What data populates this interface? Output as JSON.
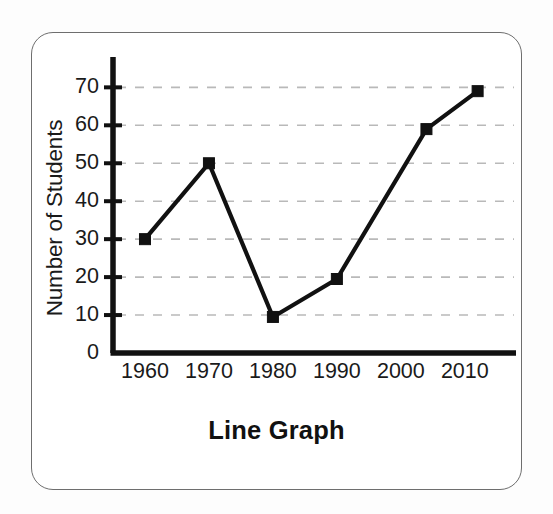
{
  "figure": {
    "title": "Line Graph",
    "y_axis_title": "Number of Students",
    "frame_color": "#6e6e6e",
    "background_color": "#ffffff",
    "series_color": "#111111",
    "gridline_color": "#b9b9b9"
  },
  "axes": {
    "y_ticks": [
      "0",
      "10",
      "20",
      "30",
      "40",
      "50",
      "60",
      "70"
    ],
    "x_ticks": [
      "1960",
      "1970",
      "1980",
      "1990",
      "2000",
      "2010"
    ]
  },
  "chart_data": {
    "type": "line",
    "title": "Line Graph",
    "xlabel": "",
    "ylabel": "Number of Students",
    "categories": [
      "1960",
      "1970",
      "1980",
      "1990",
      "2000",
      "2010"
    ],
    "x": [
      1960,
      1970,
      1980,
      1990,
      2004,
      2012
    ],
    "values": [
      30,
      50,
      9.5,
      19.5,
      59,
      69
    ],
    "ylim": [
      0,
      78
    ],
    "xlim": [
      1955,
      2018
    ],
    "ytick_values": [
      0,
      10,
      20,
      30,
      40,
      50,
      60,
      70
    ],
    "xtick_values": [
      1960,
      1970,
      1980,
      1990,
      2000,
      2010
    ],
    "grid": true,
    "grid_axis": "y",
    "grid_style": "dashed",
    "legend": false,
    "marker": "square",
    "points": [
      {
        "label": "1960",
        "x": 1960,
        "y": 30
      },
      {
        "label": "1970",
        "x": 1970,
        "y": 50
      },
      {
        "label": "1980",
        "x": 1980,
        "y": 9.5
      },
      {
        "label": "1990",
        "x": 1990,
        "y": 19.5
      },
      {
        "label": "2000",
        "x": 2004,
        "y": 59
      },
      {
        "label": "2010",
        "x": 2012,
        "y": 69
      }
    ]
  }
}
